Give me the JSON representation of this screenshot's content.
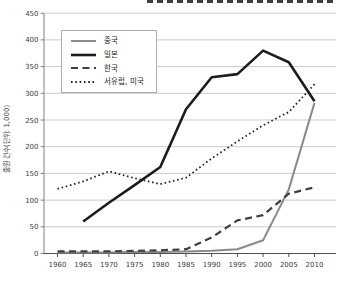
{
  "cropped_title_visible": true,
  "chart_data": {
    "type": "line",
    "ylabel": "출원 건수(단위: 1,000)",
    "ylim": [
      0,
      450
    ],
    "ytick_step": 50,
    "grid": true,
    "legend_position": "top-left",
    "x": [
      1960,
      1965,
      1970,
      1975,
      1980,
      1985,
      1990,
      1995,
      2000,
      2005,
      2010
    ],
    "series": [
      {
        "name": "중국",
        "slug": "china",
        "style": "solid",
        "color": "#8a8a8a",
        "width": 2,
        "values": [
          2,
          2,
          2,
          3,
          3,
          4,
          5,
          8,
          25,
          120,
          282
        ]
      },
      {
        "name": "일본",
        "slug": "japan",
        "style": "solid",
        "color": "#1c1c1c",
        "width": 2.6,
        "values": [
          null,
          60,
          95,
          128,
          162,
          270,
          330,
          336,
          380,
          358,
          285
        ]
      },
      {
        "name": "한국",
        "slug": "korea",
        "style": "dashed",
        "color": "#3f3f3f",
        "width": 2.2,
        "values": [
          4,
          4,
          4,
          5,
          6,
          8,
          30,
          62,
          72,
          112,
          124
        ]
      },
      {
        "name": "서유럽, 미국",
        "slug": "western-europe-usa",
        "style": "dotted",
        "color": "#262626",
        "width": 1.8,
        "values": [
          121,
          135,
          154,
          141,
          130,
          142,
          178,
          210,
          240,
          265,
          317
        ]
      }
    ]
  }
}
